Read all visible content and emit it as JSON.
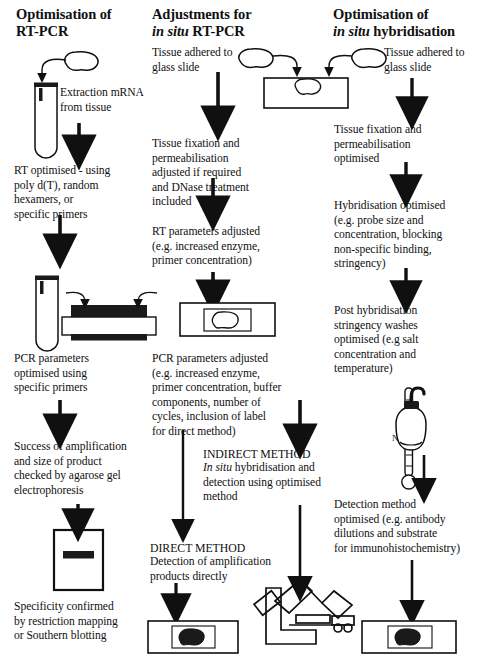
{
  "diagram": {
    "columns": [
      {
        "id": "rt-pcr",
        "heading_line1": "Optimisation of",
        "heading_line2": "RT-PCR",
        "steps": [
          {
            "id": "extraction",
            "text": "Extraction mRNA\nfrom tissue"
          },
          {
            "id": "rt-optimised",
            "text": "RT optimised - using\npoly d(T), random\nhexamers, or\nspecific primers"
          },
          {
            "id": "pcr-parameters",
            "text": "PCR parameters\noptimised using\nspecific primers"
          },
          {
            "id": "success-amplification",
            "text": "Success of amplification\nand size of product\nchecked by agarose gel\nelectrophoresis"
          },
          {
            "id": "specificity",
            "text": "Specificity confirmed\nby restriction mapping\nor Southern blotting"
          }
        ],
        "figure_labels": {
          "thermocycler": "Thermocycling"
        }
      },
      {
        "id": "in-situ-rt-pcr",
        "heading_line1": "Adjustments for",
        "heading_line2_italic": "in situ",
        "heading_line2_rest": " RT-PCR",
        "steps": [
          {
            "id": "tissue-adhered",
            "text": "Tissue adhered to\nglass slide"
          },
          {
            "id": "tissue-fixation",
            "text": "Tissue fixation and\npermeabilisation\nadjusted if required\nand DNase treatment\nincluded"
          },
          {
            "id": "rt-parameters",
            "text": "RT parameters adjusted\n(e.g. increased enzyme,\nprimer concentration)"
          },
          {
            "id": "pcr-parameters-adjusted",
            "text": "PCR parameters adjusted\n(e.g. increased enzyme,\nprimer concentration, buffer\ncomponents, number of\ncycles, inclusion of label\nfor direct method)"
          },
          {
            "id": "indirect-method-title",
            "text": "INDIRECT METHOD"
          },
          {
            "id": "indirect-method-body-italic",
            "text": "In situ"
          },
          {
            "id": "indirect-method-body",
            "text": " hybridisation and\ndetection using optimised\nmethod"
          },
          {
            "id": "direct-method-title",
            "text": "DIRECT METHOD"
          },
          {
            "id": "direct-method-body",
            "text": "Detection of amplification\nproducts directly"
          }
        ]
      },
      {
        "id": "in-situ-hybridisation",
        "heading_line1": "Optimisation of",
        "heading_line2_italic": "in situ",
        "heading_line2_rest": " hybridisation",
        "steps": [
          {
            "id": "tissue-adhered-r",
            "text": "Tissue adhered to\nglass slide"
          },
          {
            "id": "tissue-fixation-r",
            "text": "Tissue fixation and\npermeabilisation\noptimised"
          },
          {
            "id": "hybridisation-optimised",
            "text": "Hybridisation optimised\n(e.g. probe size and\nconcentration, blocking\nnon-specific binding,\nstringency)"
          },
          {
            "id": "post-hybridisation",
            "text": "Post hybridisation\nstringency washes\noptimised (e.g salt\nconcentration and\ntemperature)"
          },
          {
            "id": "detection-method",
            "text": "Detection method\noptimised (e.g. antibody\ndilutions and substrate\nfor immunohistochemistry)"
          }
        ],
        "figure_labels": {
          "salt_bottle": "Na",
          "salt_bottle_sup": "2+"
        }
      }
    ],
    "figures": [
      {
        "id": "tissue-blob-left",
        "name": "tissue-blob-icon"
      },
      {
        "id": "test-tube-left",
        "name": "test-tube-icon"
      },
      {
        "id": "thermocycler",
        "name": "thermocycler-icon"
      },
      {
        "id": "agarose-gel",
        "name": "agarose-gel-icon"
      },
      {
        "id": "tissue-blob-mid",
        "name": "tissue-blob-icon"
      },
      {
        "id": "glass-slide-mid-top",
        "name": "glass-slide-icon"
      },
      {
        "id": "glass-slide-mid-middle",
        "name": "glass-slide-icon"
      },
      {
        "id": "glass-slide-mid-bottom",
        "name": "glass-slide-stained-icon"
      },
      {
        "id": "microscope",
        "name": "microscope-icon"
      },
      {
        "id": "tissue-blob-right",
        "name": "tissue-blob-icon"
      },
      {
        "id": "thermometer",
        "name": "thermometer-icon"
      },
      {
        "id": "salt-bottle",
        "name": "reagent-bottle-icon"
      },
      {
        "id": "glass-slide-right-bottom",
        "name": "glass-slide-stained-icon"
      }
    ],
    "colors": {
      "ink": "#101010",
      "background": "#ffffff",
      "fill_dark": "#1a1a1a"
    }
  }
}
